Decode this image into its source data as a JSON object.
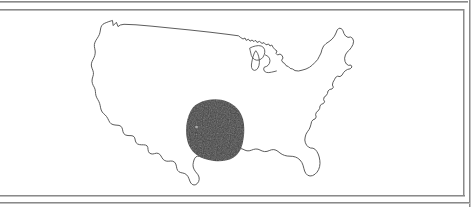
{
  "figure": {
    "kind": "scanned-figure-plate",
    "frame": {
      "style": "double-rule-border",
      "rule_color": "#8a8a8a",
      "background": "#ffffff"
    },
    "map": {
      "name": "contiguous-united-states-outline-map",
      "projection_look": "albers-like",
      "outline_color": "#4a4a4a",
      "fill_color": "#ffffff",
      "features": [
        "national-border",
        "pacific-coast",
        "atlantic-coast",
        "gulf-coast",
        "great-lakes",
        "florida-peninsula",
        "cape-cod",
        "puget-sound-notch",
        "lake-of-the-woods-notch",
        "texas-southern-tip"
      ]
    },
    "shaded_region": {
      "name": "southwest-four-corners-shaded-area",
      "shape": "rounded-blob",
      "fill_color": "#3f3f3f",
      "approx_center_x": 214,
      "approx_center_y": 130,
      "approx_width": 57,
      "approx_height": 60
    }
  },
  "icons": {
    "map_icon": "map-outline-icon",
    "region_icon": "shaded-region-icon"
  }
}
